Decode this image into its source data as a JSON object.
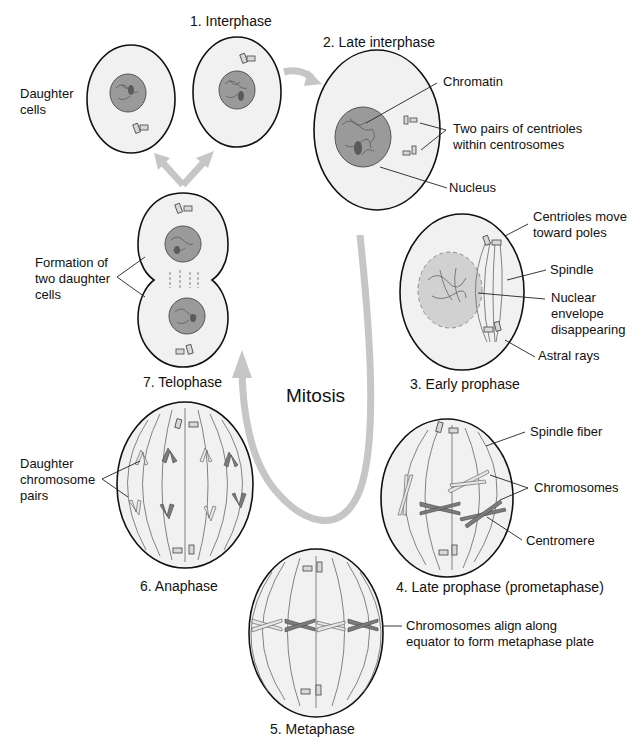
{
  "diagram": {
    "title": "Mitosis",
    "phases": [
      {
        "id": 1,
        "label": "1. Interphase"
      },
      {
        "id": 2,
        "label": "2. Late interphase"
      },
      {
        "id": 3,
        "label": "3. Early prophase"
      },
      {
        "id": 4,
        "label": "4. Late prophase (prometaphase)"
      },
      {
        "id": 5,
        "label": "5. Metaphase"
      },
      {
        "id": 6,
        "label": "6. Anaphase"
      },
      {
        "id": 7,
        "label": "7. Telophase"
      }
    ],
    "annotations": {
      "daughter_cells": [
        "Daughter",
        "cells"
      ],
      "chromatin": "Chromatin",
      "centrioles_pairs": [
        "Two pairs of centrioles",
        "within centrosomes"
      ],
      "nucleus": "Nucleus",
      "centrioles_move": [
        "Centrioles move",
        "toward poles"
      ],
      "spindle": "Spindle",
      "nuclear_envelope": [
        "Nuclear",
        "envelope",
        "disappearing"
      ],
      "astral_rays": "Astral rays",
      "formation": [
        "Formation of",
        "two daughter",
        "cells"
      ],
      "spindle_fiber": "Spindle fiber",
      "chromosomes": "Chromosomes",
      "centromere": "Centromere",
      "daughter_chromosome_pairs": [
        "Daughter",
        "chromosome",
        "pairs"
      ],
      "metaphase_plate": [
        "Chromosomes align along",
        "equator to form metaphase plate"
      ]
    },
    "colors": {
      "arrow": "#c6c6c6",
      "cell_fill": "#f1f1f1",
      "outline": "#111111",
      "nucleus": "#9a9a9a"
    }
  }
}
